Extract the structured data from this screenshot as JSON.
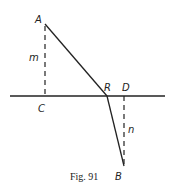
{
  "diagram": {
    "labels": {
      "A": "A",
      "B": "B",
      "C": "C",
      "D": "D",
      "R": "R",
      "m": "m",
      "n": "n"
    },
    "caption": "Fig. 91",
    "colors": {
      "stroke": "#222222",
      "background": "#ffffff"
    }
  }
}
